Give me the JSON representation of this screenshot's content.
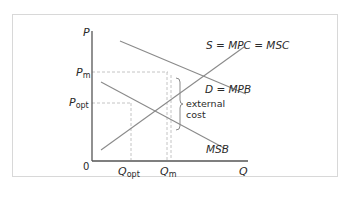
{
  "diagram": {
    "type": "economics-negative-externality-of-consumption",
    "axes": {
      "y_label": "P",
      "x_label": "Q",
      "origin_label": "0"
    },
    "price_labels": {
      "pm_main": "P",
      "pm_sub": "m",
      "popt_main": "P",
      "popt_sub": "opt"
    },
    "quantity_labels": {
      "qopt_main": "Q",
      "qopt_sub": "opt",
      "qm_main": "Q",
      "qm_sub": "m"
    },
    "curves": {
      "supply": "S = MPC = MSC",
      "demand": "D = MPB",
      "msb": "MSB"
    },
    "annotation": {
      "line1": "external",
      "line2": "cost"
    },
    "colors": {
      "curve": "#8a8a8a",
      "axis": "#555555",
      "guide": "#b0b0b0",
      "text": "#2a2a2a"
    }
  }
}
